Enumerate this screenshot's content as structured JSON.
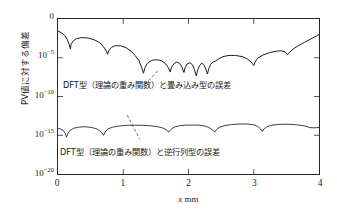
{
  "chart_data": {
    "type": "line",
    "title": "",
    "xlabel": "x mm",
    "ylabel": "PV値に対する偏差",
    "xlim": [
      0,
      4
    ],
    "ylim_log": [
      1e-20,
      1
    ],
    "grid": false,
    "legend_position": "inline-annotations",
    "xticks": [
      "0",
      "1",
      "2",
      "3",
      "4"
    ],
    "yticks": [
      {
        "base": "0",
        "exp": ""
      },
      {
        "base": "10",
        "exp": "-5"
      },
      {
        "base": "10",
        "exp": "-10"
      },
      {
        "base": "10",
        "exp": "-15"
      },
      {
        "base": "10",
        "exp": "-20"
      }
    ],
    "series": [
      {
        "name": "DFT型（理論の重み関数）と畳み込み型の誤差",
        "color": "#1a1a1a",
        "points": [
          [
            0.0,
            -1.55
          ],
          [
            0.05,
            -1.75
          ],
          [
            0.1,
            -2.1
          ],
          [
            0.14,
            -2.6
          ],
          [
            0.17,
            -3.25
          ],
          [
            0.19,
            -3.85
          ],
          [
            0.2,
            -3.3
          ],
          [
            0.23,
            -2.85
          ],
          [
            0.28,
            -2.55
          ],
          [
            0.36,
            -2.4
          ],
          [
            0.46,
            -2.45
          ],
          [
            0.56,
            -2.7
          ],
          [
            0.64,
            -3.05
          ],
          [
            0.7,
            -3.6
          ],
          [
            0.74,
            -4.15
          ],
          [
            0.76,
            -4.55
          ],
          [
            0.78,
            -4.05
          ],
          [
            0.82,
            -3.65
          ],
          [
            0.88,
            -3.45
          ],
          [
            0.96,
            -3.45
          ],
          [
            1.04,
            -3.7
          ],
          [
            1.12,
            -4.15
          ],
          [
            1.18,
            -4.7
          ],
          [
            1.24,
            -5.35
          ],
          [
            1.28,
            -6.2
          ],
          [
            1.31,
            -7.0
          ],
          [
            1.33,
            -6.35
          ],
          [
            1.37,
            -5.7
          ],
          [
            1.43,
            -5.35
          ],
          [
            1.5,
            -5.25
          ],
          [
            1.58,
            -5.35
          ],
          [
            1.64,
            -5.7
          ],
          [
            1.69,
            -6.25
          ],
          [
            1.72,
            -6.85
          ],
          [
            1.74,
            -6.2
          ],
          [
            1.78,
            -5.75
          ],
          [
            1.82,
            -5.55
          ],
          [
            1.86,
            -5.7
          ],
          [
            1.9,
            -6.2
          ],
          [
            1.93,
            -6.9
          ],
          [
            1.95,
            -6.25
          ],
          [
            1.98,
            -5.8
          ],
          [
            2.02,
            -5.65
          ],
          [
            2.06,
            -5.9
          ],
          [
            2.09,
            -6.5
          ],
          [
            2.12,
            -7.35
          ],
          [
            2.14,
            -6.6
          ],
          [
            2.17,
            -6.0
          ],
          [
            2.2,
            -5.7
          ],
          [
            2.23,
            -5.85
          ],
          [
            2.26,
            -6.35
          ],
          [
            2.29,
            -7.1
          ],
          [
            2.31,
            -6.4
          ],
          [
            2.34,
            -5.85
          ],
          [
            2.37,
            -5.55
          ],
          [
            2.41,
            -5.45
          ],
          [
            2.46,
            -5.15
          ],
          [
            2.53,
            -4.85
          ],
          [
            2.62,
            -4.7
          ],
          [
            2.72,
            -4.7
          ],
          [
            2.82,
            -4.85
          ],
          [
            2.9,
            -5.15
          ],
          [
            2.96,
            -5.55
          ],
          [
            3.0,
            -6.0
          ],
          [
            3.02,
            -5.55
          ],
          [
            3.06,
            -5.05
          ],
          [
            3.14,
            -4.65
          ],
          [
            3.24,
            -4.35
          ],
          [
            3.34,
            -4.15
          ],
          [
            3.42,
            -4.1
          ],
          [
            3.48,
            -4.25
          ],
          [
            3.52,
            -4.6
          ],
          [
            3.55,
            -4.3
          ],
          [
            3.6,
            -3.9
          ],
          [
            3.68,
            -3.45
          ],
          [
            3.78,
            -3.0
          ],
          [
            3.88,
            -2.55
          ],
          [
            3.96,
            -2.2
          ],
          [
            4.0,
            -2.0
          ]
        ]
      },
      {
        "name": "DFT型（理論の重み関数）と逆行列型の誤差",
        "color": "#1a1a1a",
        "points": [
          [
            0.0,
            -14.1
          ],
          [
            0.04,
            -14.2
          ],
          [
            0.08,
            -14.4
          ],
          [
            0.11,
            -14.75
          ],
          [
            0.13,
            -15.25
          ],
          [
            0.15,
            -14.8
          ],
          [
            0.18,
            -14.4
          ],
          [
            0.24,
            -14.1
          ],
          [
            0.32,
            -13.95
          ],
          [
            0.42,
            -13.9
          ],
          [
            0.52,
            -14.0
          ],
          [
            0.6,
            -14.2
          ],
          [
            0.66,
            -14.55
          ],
          [
            0.7,
            -15.0
          ],
          [
            0.72,
            -14.6
          ],
          [
            0.76,
            -14.2
          ],
          [
            0.84,
            -13.95
          ],
          [
            0.94,
            -13.8
          ],
          [
            1.06,
            -13.72
          ],
          [
            1.18,
            -13.7
          ],
          [
            1.3,
            -13.72
          ],
          [
            1.42,
            -13.78
          ],
          [
            1.52,
            -13.88
          ],
          [
            1.6,
            -14.05
          ],
          [
            1.66,
            -14.3
          ],
          [
            1.7,
            -14.6
          ],
          [
            1.73,
            -14.25
          ],
          [
            1.78,
            -13.95
          ],
          [
            1.86,
            -13.78
          ],
          [
            1.96,
            -13.7
          ],
          [
            2.06,
            -13.68
          ],
          [
            2.16,
            -13.7
          ],
          [
            2.24,
            -13.8
          ],
          [
            2.31,
            -13.98
          ],
          [
            2.36,
            -14.25
          ],
          [
            2.4,
            -14.6
          ],
          [
            2.43,
            -14.25
          ],
          [
            2.48,
            -13.95
          ],
          [
            2.56,
            -13.75
          ],
          [
            2.66,
            -13.62
          ],
          [
            2.78,
            -13.55
          ],
          [
            2.9,
            -13.55
          ],
          [
            3.0,
            -13.65
          ],
          [
            3.06,
            -13.85
          ],
          [
            3.1,
            -14.15
          ],
          [
            3.13,
            -14.5
          ],
          [
            3.16,
            -14.15
          ],
          [
            3.2,
            -13.9
          ],
          [
            3.28,
            -13.7
          ],
          [
            3.38,
            -13.6
          ],
          [
            3.5,
            -13.58
          ],
          [
            3.62,
            -13.62
          ],
          [
            3.72,
            -13.72
          ],
          [
            3.8,
            -13.85
          ],
          [
            3.86,
            -14.0
          ],
          [
            3.92,
            -14.05
          ],
          [
            4.0,
            -14.0
          ]
        ]
      }
    ],
    "annotations": [
      {
        "id": "upper",
        "text": "DFT型（理論の重み関数）と畳み込み型の誤差",
        "leader": {
          "x1": 0.382,
          "y1": 0.335,
          "x2": 0.315,
          "y2": 0.455
        }
      },
      {
        "id": "lower",
        "text": "DFT型（理論の重み関数）と逆行列型の誤差",
        "leader": {
          "x1": 0.265,
          "y1": 0.62,
          "x2": 0.313,
          "y2": 0.775
        }
      }
    ]
  },
  "axis": {
    "frame_color": "#262626",
    "curve_color": "#1a1a1a"
  }
}
